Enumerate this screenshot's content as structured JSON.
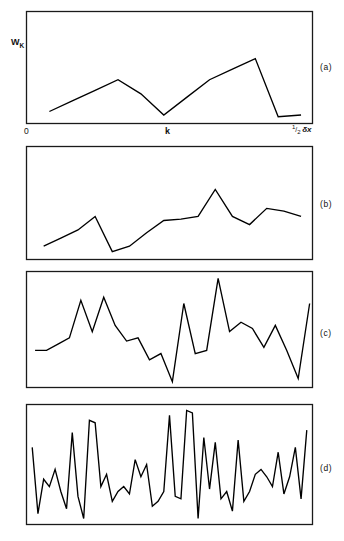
{
  "figure": {
    "background": "#ffffff",
    "ink_color": "#000000",
    "frame_color": "#1a1a1a",
    "axis_labels": {
      "y_symbol": "W",
      "y_subscript": "K",
      "x_origin": "0",
      "x_center": "k",
      "x_max_fraction_numerator": "1",
      "x_max_fraction_denominator": "2",
      "x_max_symbol": "δx"
    },
    "panel_tags": [
      "(a)",
      "(b)",
      "(c)",
      "(d)"
    ]
  },
  "chart_data": [
    {
      "type": "line",
      "title": "",
      "panel": "(a)",
      "xlabel": "k",
      "ylabel": "W_K",
      "xlim": [
        0,
        100
      ],
      "ylim": [
        0,
        100
      ],
      "grid": false,
      "legend": "none",
      "annotations": [
        "(a)"
      ],
      "x": [
        8,
        16,
        24,
        32,
        40,
        48,
        56,
        64,
        72,
        80,
        88,
        96
      ],
      "values": [
        12,
        18,
        24,
        30,
        22,
        10,
        20,
        30,
        36,
        42,
        9,
        10
      ]
    },
    {
      "type": "line",
      "title": "",
      "panel": "(b)",
      "xlabel": "",
      "ylabel": "",
      "xlim": [
        0,
        100
      ],
      "ylim": [
        0,
        100
      ],
      "grid": false,
      "legend": "none",
      "annotations": [
        "(b)"
      ],
      "x": [
        6,
        12,
        18,
        24,
        30,
        36,
        42,
        48,
        54,
        60,
        66,
        72,
        78,
        84,
        90,
        96
      ],
      "values": [
        14,
        20,
        26,
        36,
        10,
        14,
        24,
        33,
        34,
        36,
        56,
        36,
        30,
        42,
        40,
        36
      ]
    },
    {
      "type": "line",
      "title": "",
      "panel": "(c)",
      "xlabel": "",
      "ylabel": "",
      "xlim": [
        0,
        100
      ],
      "ylim": [
        0,
        100
      ],
      "grid": false,
      "legend": "none",
      "annotations": [
        "(c)"
      ],
      "x": [
        3,
        7,
        11,
        15,
        19,
        23,
        27,
        31,
        35,
        39,
        43,
        47,
        51,
        55,
        59,
        63,
        67,
        71,
        75,
        79,
        83,
        87,
        91,
        95,
        99
      ],
      "values": [
        24,
        24,
        28,
        32,
        56,
        36,
        58,
        40,
        30,
        32,
        18,
        22,
        4,
        54,
        22,
        24,
        70,
        36,
        42,
        38,
        26,
        40,
        24,
        6,
        54
      ]
    },
    {
      "type": "line",
      "title": "",
      "panel": "(d)",
      "xlabel": "",
      "ylabel": "",
      "xlim": [
        0,
        100
      ],
      "ylim": [
        0,
        100
      ],
      "grid": false,
      "legend": "none",
      "annotations": [
        "(d)"
      ],
      "x": [
        2,
        4,
        6,
        8,
        10,
        12,
        14,
        16,
        18,
        20,
        22,
        24,
        26,
        28,
        30,
        32,
        34,
        36,
        38,
        40,
        42,
        44,
        46,
        48,
        50,
        52,
        54,
        56,
        58,
        60,
        62,
        64,
        66,
        68,
        70,
        72,
        74,
        76,
        78,
        80,
        82,
        84,
        86,
        88,
        90,
        92,
        94,
        96,
        98
      ],
      "values": [
        62,
        8,
        36,
        30,
        44,
        26,
        12,
        74,
        22,
        4,
        84,
        82,
        30,
        40,
        18,
        26,
        30,
        24,
        52,
        38,
        48,
        14,
        18,
        26,
        88,
        22,
        20,
        92,
        90,
        4,
        70,
        28,
        66,
        20,
        26,
        10,
        68,
        18,
        26,
        40,
        44,
        38,
        30,
        58,
        24,
        38,
        62,
        20,
        76
      ]
    }
  ]
}
